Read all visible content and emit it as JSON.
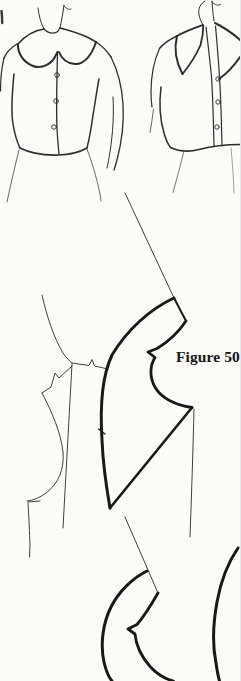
{
  "figure": {
    "label": "Figure 50"
  },
  "colors": {
    "paper": "#fcfbf8",
    "ink_heavy": "#181818",
    "ink_medium": "#2d2d2d",
    "ink_thin": "#3f3f3f",
    "ink_faint": "#6a6a6a"
  },
  "illustrations": {
    "left_blouse": "blouse-with-round-peter-pan-collar",
    "right_blouse": "blouse-with-pointed-collar",
    "main_diagram": "collar-and-bodice-pattern-draft",
    "bottom_diagram": "partial-collar-pattern-draft"
  }
}
